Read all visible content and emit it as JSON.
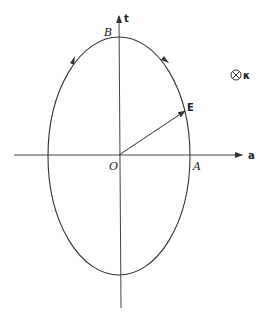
{
  "diagram": {
    "type": "polarization-ellipse",
    "labels": {
      "origin": "O",
      "point_a": "A",
      "point_b": "B",
      "vector": "E",
      "axis_horizontal": "a",
      "axis_vertical": "t",
      "wave_vector": "κ"
    },
    "geometry": {
      "center": [
        119,
        155
      ],
      "semi_axis_horizontal": 71,
      "semi_axis_vertical": 118,
      "vector_tip": [
        185,
        111
      ]
    },
    "rotation_direction": "counterclockwise",
    "wave_vector_symbol": "into-page (circle with cross)",
    "colors": {
      "stroke": "#333333",
      "background": "#ffffff"
    }
  }
}
